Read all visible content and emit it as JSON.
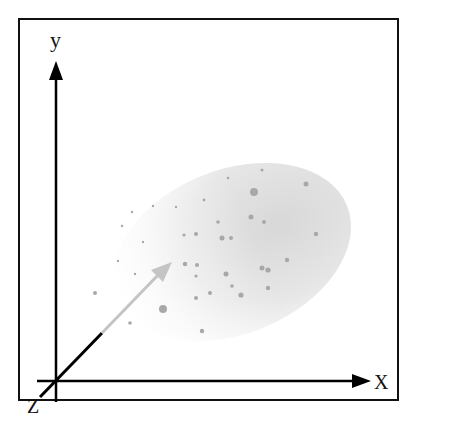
{
  "diagram": {
    "type": "3d-coordinate-system",
    "axes": {
      "x_label": "X",
      "y_label": "y",
      "z_label": "Z"
    },
    "elements": {
      "point_cloud": "elliptical gray gradient region with scattered dots",
      "vector": "arrow from origin toward the point cloud (black near origin, fading to gray)"
    },
    "colors": {
      "frame": "#111111",
      "axes": "#000000",
      "cloud_dark": "#d6d6d6",
      "cloud_light": "#ffffff",
      "dots": "#a8a8a8",
      "vector_near": "#000000",
      "vector_far": "#c4c4c4"
    }
  }
}
